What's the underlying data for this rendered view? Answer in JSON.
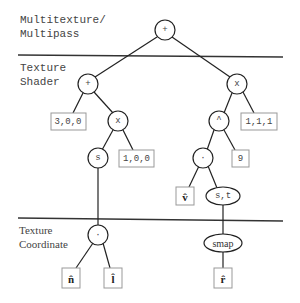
{
  "sections": {
    "multitexture": {
      "line1": "Multitexture/",
      "line2": "Multipass"
    },
    "texture_shader": {
      "line1": "Texture",
      "line2": "Shader"
    },
    "texture_coordinate": {
      "line1": "Texture",
      "line2": "Coordinate"
    }
  },
  "nodes": {
    "root_add": "+",
    "left_add": "+",
    "right_mul": "x",
    "left_mul": "x",
    "s_node": "s",
    "pow_node": "^",
    "dot_upper": "·",
    "st_node": "s,t",
    "dot_lower": "·",
    "smap_node": "smap"
  },
  "leaves": {
    "vec_300": "3,0,0",
    "vec_100": "1,0,0",
    "vec_111": "1,1,1",
    "exp_9": "9",
    "v_hat": "v̂",
    "n_hat": "n̂",
    "l_hat": "l̂",
    "r_hat": "r̂"
  },
  "colors": {
    "line": "#222222",
    "box_border": "#999999",
    "text": "#444444"
  }
}
